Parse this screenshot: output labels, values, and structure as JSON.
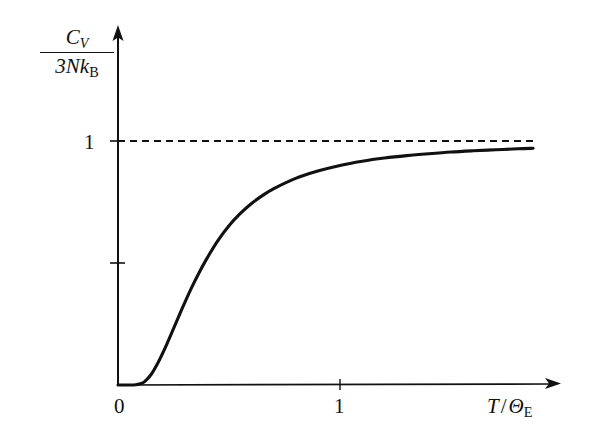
{
  "figure": {
    "title": "",
    "background_color": "#ffffff",
    "line_color": "#111111",
    "asymptote_color": "#111111"
  },
  "axes": {
    "y_label": {
      "numerator_symbol": "C",
      "numerator_subscript": "V",
      "denominator": "3Nk",
      "denominator_subscript": "B"
    },
    "x_label": {
      "numerator": "T",
      "separator": "/",
      "denominator_symbol": "Θ",
      "denominator_subscript": "E"
    },
    "x_ticks": [
      {
        "value": 0,
        "label": "0"
      },
      {
        "value": 1,
        "label": "1"
      }
    ],
    "y_ticks": [
      {
        "value": 0.5,
        "label": ""
      },
      {
        "value": 1,
        "label": "1"
      }
    ]
  },
  "annotations": [
    {
      "name": "classical-limit-asymptote",
      "type": "dashed-horizontal-line",
      "y_value": 1,
      "label": ""
    }
  ],
  "chart_data": {
    "type": "line",
    "title": "",
    "xlabel": "T/ΘE",
    "ylabel": "CV/3NkB",
    "xlim": [
      0,
      2
    ],
    "ylim": [
      0,
      1.1
    ],
    "grid": false,
    "legend": null,
    "xticks": [
      0,
      1
    ],
    "xticklabels": [
      "0",
      "1"
    ],
    "yticks": [
      0.5,
      1
    ],
    "yticklabels": [
      "",
      "1"
    ],
    "asymptote": {
      "y": 1,
      "style": "dashed"
    },
    "series": [
      {
        "name": "Einstein heat capacity",
        "x": [
          0.0,
          0.05,
          0.08,
          0.1,
          0.12,
          0.15,
          0.18,
          0.2,
          0.22,
          0.25,
          0.28,
          0.3,
          0.33,
          0.36,
          0.4,
          0.45,
          0.5,
          0.55,
          0.6,
          0.65,
          0.7,
          0.8,
          0.9,
          1.0,
          1.1,
          1.2,
          1.3,
          1.4,
          1.5,
          1.6,
          1.7,
          1.8,
          1.87
        ],
        "y": [
          0.0,
          0.0,
          0.001,
          0.005,
          0.014,
          0.044,
          0.091,
          0.128,
          0.168,
          0.231,
          0.295,
          0.336,
          0.396,
          0.451,
          0.518,
          0.592,
          0.653,
          0.702,
          0.743,
          0.776,
          0.804,
          0.847,
          0.877,
          0.9,
          0.917,
          0.93,
          0.94,
          0.948,
          0.955,
          0.96,
          0.964,
          0.968,
          0.97
        ]
      }
    ]
  }
}
